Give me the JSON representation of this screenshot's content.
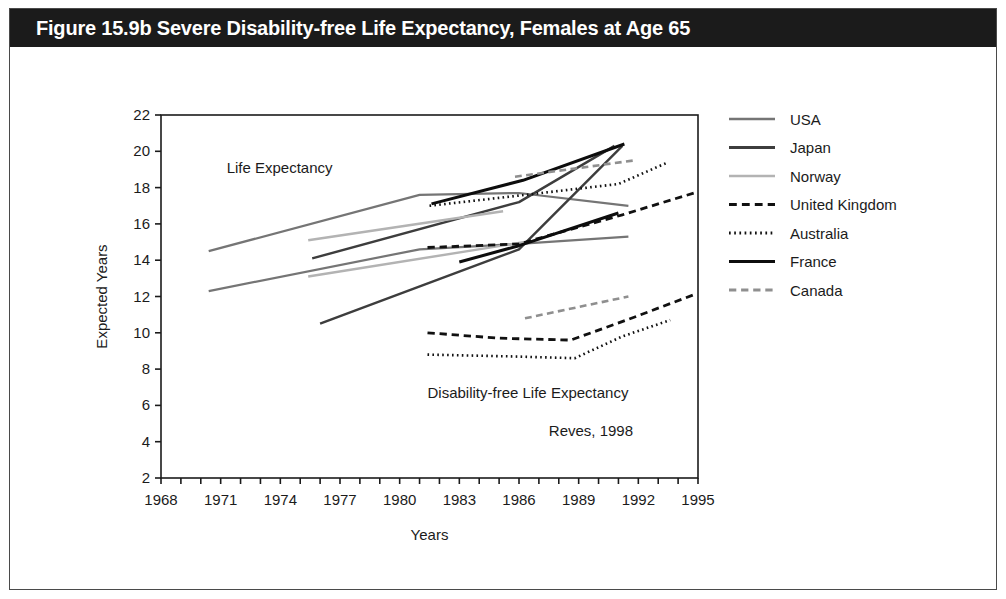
{
  "figure": {
    "title": "Figure 15.9b Severe Disability-free Life Expectancy, Females at Age 65",
    "title_bg": "#1b1b1b",
    "title_color": "#ffffff"
  },
  "annotations": {
    "life_expectancy": "Life Expectancy",
    "disability_free": "Disability-free Life Expectancy",
    "source": "Reves, 1998"
  },
  "chart_data": {
    "type": "line",
    "title": "Figure 15.9b Severe Disability-free Life Expectancy, Females at Age 65",
    "xlabel": "Years",
    "ylabel": "Expected Years",
    "xlim": [
      1968,
      1995
    ],
    "ylim": [
      2,
      22
    ],
    "xticks": [
      1968,
      1969,
      1970,
      1971,
      1972,
      1973,
      1974,
      1975,
      1976,
      1977,
      1978,
      1979,
      1980,
      1981,
      1982,
      1983,
      1984,
      1985,
      1986,
      1987,
      1988,
      1989,
      1990,
      1991,
      1992,
      1993,
      1994,
      1995
    ],
    "xtick_labels": [
      "1968",
      "1971",
      "1974",
      "1977",
      "1980",
      "1983",
      "1986",
      "1989",
      "1992",
      "1995"
    ],
    "xtick_label_values": [
      1968,
      1971,
      1974,
      1977,
      1980,
      1983,
      1986,
      1989,
      1992,
      1995
    ],
    "yticks": [
      2,
      4,
      6,
      8,
      10,
      12,
      14,
      16,
      18,
      20,
      22
    ],
    "ytick_labels": [
      "2",
      "4",
      "6",
      "8",
      "10",
      "12",
      "14",
      "16",
      "18",
      "20",
      "22"
    ],
    "grid": false,
    "legend_position": "right",
    "annotations": [
      {
        "text": "Life Expectancy",
        "x": 1971.3,
        "y": 18.8
      },
      {
        "text": "Disability-free Life Expectancy",
        "x": 1981.4,
        "y": 6.4
      },
      {
        "text": "Reves, 1998",
        "x": 1987.5,
        "y": 4.3
      }
    ],
    "series": [
      {
        "name": "USA",
        "group": "life-expectancy",
        "color": "#757575",
        "style": "solid",
        "width": 2.2,
        "points": [
          [
            1970.4,
            14.5
          ],
          [
            1981.0,
            17.6
          ],
          [
            1986.0,
            17.7
          ],
          [
            1991.5,
            17.0
          ]
        ]
      },
      {
        "name": "USA",
        "group": "disability-free-upper",
        "color": "#757575",
        "style": "solid",
        "width": 2.2,
        "points": [
          [
            1970.4,
            12.3
          ],
          [
            1981.0,
            14.6
          ],
          [
            1986.0,
            14.9
          ],
          [
            1991.5,
            15.3
          ]
        ]
      },
      {
        "name": "Japan",
        "group": "life-expectancy",
        "color": "#3d3d3d",
        "style": "solid",
        "width": 2.4,
        "points": [
          [
            1976.0,
            10.5
          ],
          [
            1986.0,
            14.6
          ],
          [
            1991.2,
            20.3
          ]
        ]
      },
      {
        "name": "Japan",
        "group": "disability-free-upper",
        "color": "#3d3d3d",
        "style": "solid",
        "width": 2.4,
        "points": [
          [
            1975.6,
            14.1
          ],
          [
            1986.0,
            17.2
          ],
          [
            1990.8,
            20.3
          ]
        ]
      },
      {
        "name": "Norway",
        "group": "life-expectancy",
        "color": "#b3b3b3",
        "style": "solid",
        "width": 2.4,
        "points": [
          [
            1975.4,
            15.1
          ],
          [
            1985.2,
            16.7
          ]
        ]
      },
      {
        "name": "Norway",
        "group": "disability-free-upper",
        "color": "#b3b3b3",
        "style": "solid",
        "width": 2.4,
        "points": [
          [
            1975.4,
            13.1
          ],
          [
            1986.3,
            15.0
          ]
        ]
      },
      {
        "name": "United Kingdom",
        "group": "life-expectancy",
        "color": "#111111",
        "style": "dashed",
        "width": 2.8,
        "points": [
          [
            1981.4,
            14.7
          ],
          [
            1986.0,
            14.9
          ],
          [
            1991.2,
            16.5
          ],
          [
            1994.8,
            17.7
          ]
        ]
      },
      {
        "name": "United Kingdom",
        "group": "disability-free",
        "color": "#111111",
        "style": "dashed",
        "width": 2.8,
        "points": [
          [
            1981.4,
            10.0
          ],
          [
            1985.0,
            9.7
          ],
          [
            1988.6,
            9.6
          ],
          [
            1991.4,
            10.7
          ],
          [
            1994.8,
            12.1
          ]
        ]
      },
      {
        "name": "Australia",
        "group": "life-expectancy",
        "color": "#111111",
        "style": "dotted",
        "width": 2.6,
        "points": [
          [
            1981.5,
            17.0
          ],
          [
            1986.3,
            17.6
          ],
          [
            1991.0,
            18.2
          ],
          [
            1993.5,
            19.4
          ]
        ]
      },
      {
        "name": "Australia",
        "group": "disability-free",
        "color": "#111111",
        "style": "dotted",
        "width": 2.6,
        "points": [
          [
            1981.4,
            8.8
          ],
          [
            1985.6,
            8.7
          ],
          [
            1988.8,
            8.6
          ],
          [
            1991.2,
            9.8
          ],
          [
            1993.6,
            10.7
          ]
        ]
      },
      {
        "name": "France",
        "group": "life-expectancy",
        "color": "#0d0d0d",
        "style": "solid",
        "width": 3.0,
        "points": [
          [
            1981.6,
            17.1
          ],
          [
            1986.2,
            18.4
          ],
          [
            1991.3,
            20.4
          ]
        ]
      },
      {
        "name": "France",
        "group": "disability-free-upper",
        "color": "#0d0d0d",
        "style": "solid",
        "width": 3.0,
        "points": [
          [
            1983.0,
            13.9
          ],
          [
            1986.0,
            14.8
          ],
          [
            1991.0,
            16.6
          ]
        ]
      },
      {
        "name": "Canada",
        "group": "life-expectancy",
        "color": "#8f8f8f",
        "style": "dashed",
        "width": 2.6,
        "points": [
          [
            1985.8,
            18.6
          ],
          [
            1991.8,
            19.5
          ]
        ]
      },
      {
        "name": "Canada",
        "group": "disability-free",
        "color": "#8f8f8f",
        "style": "dashed",
        "width": 2.6,
        "points": [
          [
            1986.3,
            10.8
          ],
          [
            1991.5,
            12.0
          ]
        ]
      }
    ],
    "legend": [
      {
        "label": "USA",
        "color": "#757575",
        "style": "solid",
        "width": 2.4
      },
      {
        "label": "Japan",
        "color": "#3d3d3d",
        "style": "solid",
        "width": 2.8
      },
      {
        "label": "Norway",
        "color": "#b3b3b3",
        "style": "solid",
        "width": 2.6
      },
      {
        "label": "United Kingdom",
        "color": "#111111",
        "style": "dashed",
        "width": 3.0
      },
      {
        "label": "Australia",
        "color": "#111111",
        "style": "dotted",
        "width": 2.8
      },
      {
        "label": "France",
        "color": "#0d0d0d",
        "style": "solid",
        "width": 3.2
      },
      {
        "label": "Canada",
        "color": "#8f8f8f",
        "style": "dashed",
        "width": 2.8
      }
    ]
  }
}
